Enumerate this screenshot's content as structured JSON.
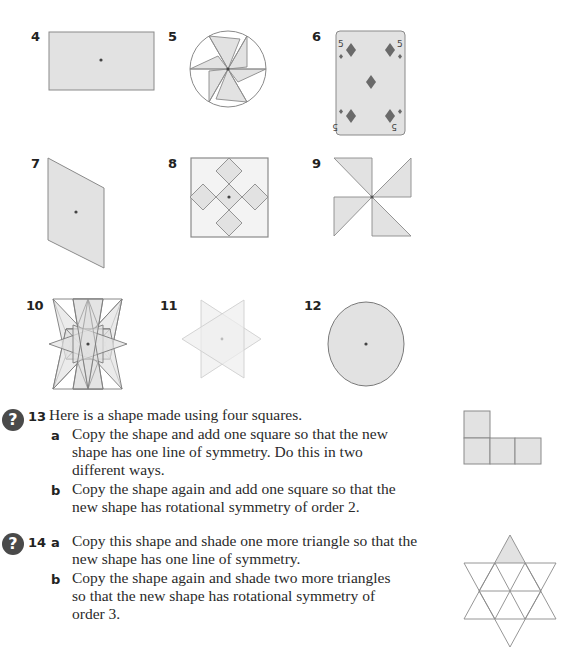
{
  "figures": [
    {
      "number": "4",
      "shape": "rectangle"
    },
    {
      "number": "5",
      "shape": "six-blade pinwheel in circle"
    },
    {
      "number": "6",
      "shape": "five of diamonds playing card",
      "card_rank": "5",
      "suit": "diamonds"
    },
    {
      "number": "7",
      "shape": "parallelogram"
    },
    {
      "number": "8",
      "shape": "square with five diamonds"
    },
    {
      "number": "9",
      "shape": "four-triangle pinwheel"
    },
    {
      "number": "10",
      "shape": "eight-pointed star"
    },
    {
      "number": "11",
      "shape": "six-pointed star (faint)"
    },
    {
      "number": "12",
      "shape": "circle"
    }
  ],
  "colors": {
    "fill": "#e2e2e2",
    "stroke": "#8a8a8a",
    "dark_fill": "#6a6a6a",
    "faint_stroke": "#cfcfcf",
    "icon": "#4a4a4a"
  },
  "questions": [
    {
      "number": "13",
      "icon": "question-mark-icon",
      "intro": "Here is a shape made using four squares.",
      "parts": [
        {
          "label": "a",
          "lines": [
            "Copy the shape and add one square so that the new",
            "shape has one line of symmetry. Do this in two",
            "different ways."
          ]
        },
        {
          "label": "b",
          "lines": [
            "Copy the shape again and add one square so that the",
            "new shape has rotational symmetry of order 2."
          ]
        }
      ]
    },
    {
      "number": "14",
      "icon": "question-mark-icon",
      "parts": [
        {
          "label": "a",
          "lines": [
            "Copy this shape and shade one more triangle so that the",
            "new shape has one line of symmetry."
          ]
        },
        {
          "label": "b",
          "lines": [
            "Copy the shape again and shade two more triangles",
            "so that the new shape has rotational symmetry of",
            "order 3."
          ]
        }
      ]
    }
  ],
  "icon_glyph": "?"
}
